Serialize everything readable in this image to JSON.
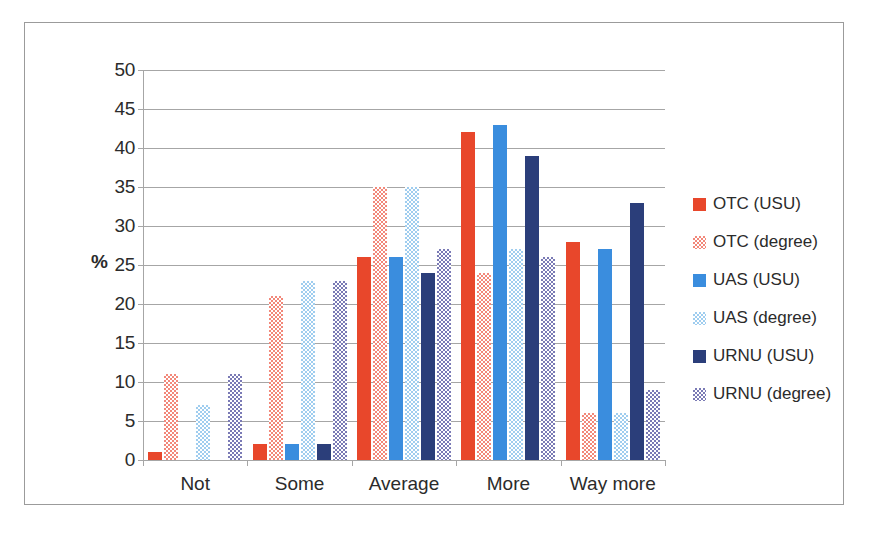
{
  "chart_data": {
    "type": "bar",
    "title": "",
    "subtitle": "",
    "xlabel": "",
    "ylabel": "%",
    "ylim": [
      0,
      50
    ],
    "ytick_step": 5,
    "yticks": [
      0,
      5,
      10,
      15,
      20,
      25,
      30,
      35,
      40,
      45,
      50
    ],
    "ytick_labels": [
      "0",
      "5",
      "10",
      "15",
      "20",
      "25",
      "30",
      "35",
      "40",
      "45",
      "50"
    ],
    "grid": true,
    "legend_position": "right",
    "categories": [
      "Not",
      "Some",
      "Average",
      "More",
      "Way more"
    ],
    "series": [
      {
        "name": "OTC (USU)",
        "color": "#e8472b",
        "fill": "solid-red",
        "values": [
          1,
          2,
          26,
          42,
          28
        ]
      },
      {
        "name": "OTC (degree)",
        "color": "#f2887a",
        "fill": "chk-red",
        "values": [
          11,
          21,
          35,
          24,
          6
        ]
      },
      {
        "name": "UAS (USU)",
        "color": "#3a8dde",
        "fill": "solid-blue",
        "values": [
          0,
          2,
          26,
          43,
          27
        ]
      },
      {
        "name": "UAS (degree)",
        "color": "#9fcdef",
        "fill": "chk-blue",
        "values": [
          7,
          23,
          35,
          27,
          6
        ]
      },
      {
        "name": "URNU (USU)",
        "color": "#2b3e7a",
        "fill": "solid-navy",
        "values": [
          0,
          2,
          24,
          39,
          33
        ]
      },
      {
        "name": "URNU (degree)",
        "color": "#7a7ab5",
        "fill": "chk-purple",
        "values": [
          11,
          23,
          27,
          26,
          9
        ]
      }
    ]
  }
}
